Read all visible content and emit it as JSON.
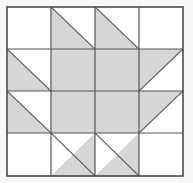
{
  "figure": {
    "kind": "geometric-quilt-block",
    "background_color": "#f7f7f7"
  },
  "colors": {
    "background": "#f7f7f7",
    "block_background": "#ffffff",
    "patch_fill": "#d6d6d6",
    "patch_fill_light": "#dcdcdc",
    "grid_line": "#555555",
    "outer_border": "#4a4a4a",
    "diagonal_line": "#6b6b6b"
  },
  "geometry": {
    "canvas_width": 193,
    "canvas_height": 183,
    "block_left": 7,
    "block_top": 7,
    "block_right": 183,
    "block_bottom": 176,
    "columns": [
      7,
      51,
      95,
      139,
      183
    ],
    "rows": [
      7,
      49,
      91,
      133,
      176
    ],
    "grid_cols": 4,
    "grid_rows": 4,
    "outer_border_width": 1.6,
    "grid_line_width": 1.2,
    "diagonal_line_width": 1.2
  },
  "center": {
    "label": "center-square",
    "x": 51,
    "y": 49,
    "width": 88,
    "height": 84,
    "fill": "#d6d6d6"
  },
  "cells": [
    {
      "id": "r0c0",
      "row": 0,
      "col": 0,
      "type": "plain",
      "fill": "white",
      "label": "plain-corner-top-left"
    },
    {
      "id": "r0c1",
      "row": 0,
      "col": 1,
      "type": "triangle",
      "orientation": "lower-left",
      "fill": "gray",
      "label": "half-square-triangle"
    },
    {
      "id": "r0c2",
      "row": 0,
      "col": 2,
      "type": "triangle",
      "orientation": "lower-left",
      "fill": "gray",
      "label": "half-square-triangle"
    },
    {
      "id": "r0c3",
      "row": 0,
      "col": 3,
      "type": "plain",
      "fill": "white",
      "label": "plain-corner-top-right"
    },
    {
      "id": "r1c0",
      "row": 1,
      "col": 0,
      "type": "triangle",
      "orientation": "lower-left",
      "fill": "gray",
      "label": "half-square-triangle"
    },
    {
      "id": "r1c1",
      "row": 1,
      "col": 1,
      "type": "center",
      "fill": "gray",
      "label": "center-quadrant"
    },
    {
      "id": "r1c2",
      "row": 1,
      "col": 2,
      "type": "center",
      "fill": "gray",
      "label": "center-quadrant"
    },
    {
      "id": "r1c3",
      "row": 1,
      "col": 3,
      "type": "triangle",
      "orientation": "upper-left",
      "fill": "gray",
      "label": "half-square-triangle"
    },
    {
      "id": "r2c0",
      "row": 2,
      "col": 0,
      "type": "triangle",
      "orientation": "lower-left",
      "fill": "gray",
      "label": "half-square-triangle"
    },
    {
      "id": "r2c1",
      "row": 2,
      "col": 1,
      "type": "center",
      "fill": "gray",
      "label": "center-quadrant"
    },
    {
      "id": "r2c2",
      "row": 2,
      "col": 2,
      "type": "center",
      "fill": "gray",
      "label": "center-quadrant"
    },
    {
      "id": "r2c3",
      "row": 2,
      "col": 3,
      "type": "triangle",
      "orientation": "upper-left",
      "fill": "gray",
      "label": "half-square-triangle"
    },
    {
      "id": "r3c0",
      "row": 3,
      "col": 0,
      "type": "plain",
      "fill": "white",
      "label": "plain-corner-bottom-left"
    },
    {
      "id": "r3c1",
      "row": 3,
      "col": 1,
      "type": "triangle",
      "orientation": "upper-right",
      "fill": "gray",
      "label": "half-square-triangle"
    },
    {
      "id": "r3c2",
      "row": 3,
      "col": 2,
      "type": "triangle",
      "orientation": "upper-right",
      "fill": "gray",
      "label": "half-square-triangle"
    },
    {
      "id": "r3c3",
      "row": 3,
      "col": 3,
      "type": "plain",
      "fill": "white",
      "label": "plain-corner-bottom-right"
    }
  ]
}
